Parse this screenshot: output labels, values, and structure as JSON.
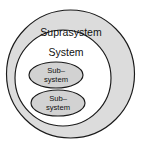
{
  "diagram": {
    "colors": {
      "suprasystem_fill": "#dcdcdc",
      "system_fill": "#ffffff",
      "subsystem_fill": "#d2d2d2",
      "outline": "#1a1a1a",
      "background": "#ffffff",
      "text": "#111111"
    },
    "levels": [
      {
        "id": "suprasystem",
        "label": "Suprasystem",
        "shape": "circle",
        "cx": 70.5,
        "cy": 74,
        "r": 64,
        "label_x": 71,
        "label_y": 33
      },
      {
        "id": "system",
        "label": "System",
        "shape": "circle",
        "cx": 63,
        "cy": 78,
        "r": 48,
        "label_x": 66,
        "label_y": 53
      }
    ],
    "subsystems": [
      {
        "id": "subsystem-1",
        "label_line1": "Sub–",
        "label_line2": "system",
        "shape": "ellipse",
        "cx": 56,
        "cy": 75,
        "rx": 27,
        "ry": 13,
        "label_x": 56,
        "label_y1": 71,
        "label_y2": 80
      },
      {
        "id": "subsystem-2",
        "label_line1": "Sub–",
        "label_line2": "system",
        "shape": "ellipse",
        "cx": 58,
        "cy": 103,
        "rx": 27,
        "ry": 13,
        "label_x": 58,
        "label_y1": 99,
        "label_y2": 108
      }
    ]
  }
}
